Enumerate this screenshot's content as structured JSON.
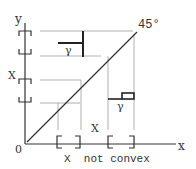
{
  "diagram": {
    "axis_labels": {
      "y": "y",
      "x": "x",
      "origin": "0"
    },
    "angle_label": "45°",
    "set_labels": {
      "left_x": "X",
      "middle_x": "X"
    },
    "gamma_labels": {
      "upper": "γ",
      "lower": "γ"
    },
    "caption": "X  not convex",
    "colors": {
      "ink": "#333333",
      "dashed": "#aaaaaa",
      "background": "#ffffff"
    }
  }
}
